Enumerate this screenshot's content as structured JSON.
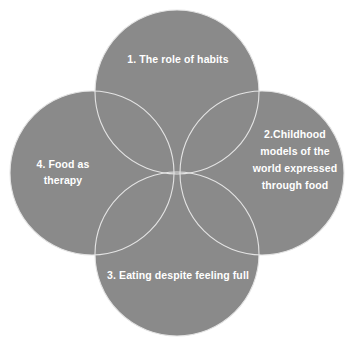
{
  "diagram": {
    "type": "four-circle-venn",
    "background_color": "#ffffff",
    "circle_fill_color": "#8a8a8a",
    "circle_outline_color": "#e8e8e8",
    "label_color": "#ffffff",
    "circles": [
      {
        "position": "top",
        "label": "1. The role of habits",
        "center_x": 177,
        "center_y": 92,
        "radius": 82
      },
      {
        "position": "right",
        "label": "2.Childhood models of the world expressed through food",
        "center_x": 262,
        "center_y": 173,
        "radius": 82
      },
      {
        "position": "bottom",
        "label": "3. Eating despite feeling full",
        "center_x": 177,
        "center_y": 254,
        "radius": 82
      },
      {
        "position": "left",
        "label": "4. Food as therapy",
        "center_x": 92,
        "center_y": 173,
        "radius": 82
      }
    ]
  }
}
